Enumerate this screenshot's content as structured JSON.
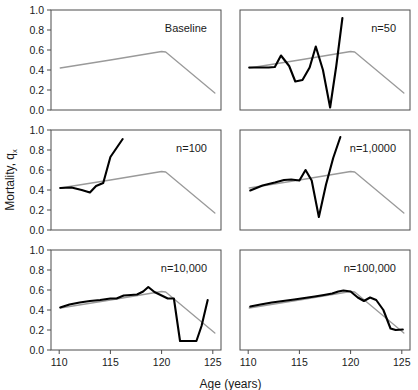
{
  "chart_data": {
    "type": "line",
    "title": "",
    "xlabel": "Age (years)",
    "ylabel": "Mortality, q",
    "ylabel_subscript": "x",
    "xlim": [
      109.2,
      125.8
    ],
    "ylim": [
      0.0,
      1.0
    ],
    "xticks": [
      110,
      115,
      120,
      125
    ],
    "xtick_labels": [
      "110",
      "115",
      "120",
      "125"
    ],
    "yticks": [
      0.0,
      0.2,
      0.4,
      0.6,
      0.8,
      1.0
    ],
    "ytick_labels": [
      "0.0",
      "0.2",
      "0.4",
      "0.6",
      "0.8",
      "1.0"
    ],
    "grid": false,
    "legend": "none",
    "layout": "2 columns x 3 rows of panels",
    "series_colors": {
      "baseline": "#9a9a9a",
      "simulated": "#000000"
    },
    "baseline": {
      "name": "Baseline",
      "color": "#9a9a9a",
      "x": [
        110.1,
        115.0,
        120.0,
        120.4,
        125.2
      ],
      "y": [
        0.42,
        0.5,
        0.585,
        0.58,
        0.17
      ]
    },
    "panels": [
      {
        "label": "Baseline",
        "show_baseline": true,
        "simulated": {
          "x": [],
          "y": []
        }
      },
      {
        "label": "n=50",
        "show_baseline": true,
        "simulated": {
          "color": "#000000",
          "x": [
            110.1,
            111.0,
            112.0,
            112.6,
            113.2,
            114.0,
            114.6,
            115.3,
            116.0,
            116.6,
            117.3,
            118.0,
            118.6,
            119.2
          ],
          "y": [
            0.425,
            0.425,
            0.425,
            0.43,
            0.545,
            0.44,
            0.285,
            0.3,
            0.425,
            0.635,
            0.4,
            0.025,
            0.44,
            0.92
          ]
        }
      },
      {
        "label": "n=100",
        "show_baseline": true,
        "simulated": {
          "color": "#000000",
          "x": [
            110.1,
            111.2,
            112.2,
            113.0,
            113.6,
            114.3,
            115.0,
            115.6,
            116.2
          ],
          "y": [
            0.42,
            0.425,
            0.4,
            0.375,
            0.44,
            0.47,
            0.73,
            0.82,
            0.91
          ]
        }
      },
      {
        "label": "n=1,0000",
        "show_baseline": true,
        "simulated": {
          "color": "#000000",
          "x": [
            110.2,
            111.4,
            112.6,
            113.5,
            114.2,
            115.0,
            115.6,
            116.2,
            116.9,
            117.6,
            118.3,
            119.0
          ],
          "y": [
            0.395,
            0.445,
            0.475,
            0.5,
            0.505,
            0.495,
            0.6,
            0.495,
            0.13,
            0.455,
            0.72,
            0.93
          ]
        }
      },
      {
        "label": "n=10,000",
        "show_baseline": true,
        "simulated": {
          "color": "#000000",
          "x": [
            110.1,
            111.0,
            112.0,
            113.0,
            114.0,
            115.0,
            115.6,
            116.3,
            117.0,
            117.6,
            118.2,
            118.7,
            119.3,
            120.0,
            120.6,
            121.2,
            121.8,
            122.5,
            123.4,
            123.9,
            124.5
          ],
          "y": [
            0.425,
            0.455,
            0.475,
            0.49,
            0.5,
            0.515,
            0.515,
            0.545,
            0.55,
            0.555,
            0.585,
            0.63,
            0.58,
            0.545,
            0.515,
            0.515,
            0.09,
            0.09,
            0.09,
            0.24,
            0.5
          ]
        }
      },
      {
        "label": "n=100,000",
        "show_baseline": true,
        "simulated": {
          "color": "#000000",
          "x": [
            110.2,
            111.2,
            112.3,
            113.4,
            114.5,
            115.5,
            116.5,
            117.4,
            118.2,
            118.8,
            119.3,
            120.0,
            120.7,
            121.3,
            121.9,
            122.5,
            123.2,
            123.9,
            124.4,
            125.1
          ],
          "y": [
            0.435,
            0.455,
            0.475,
            0.49,
            0.505,
            0.52,
            0.535,
            0.55,
            0.565,
            0.585,
            0.595,
            0.585,
            0.525,
            0.49,
            0.525,
            0.5,
            0.4,
            0.215,
            0.2,
            0.205
          ]
        }
      }
    ]
  }
}
